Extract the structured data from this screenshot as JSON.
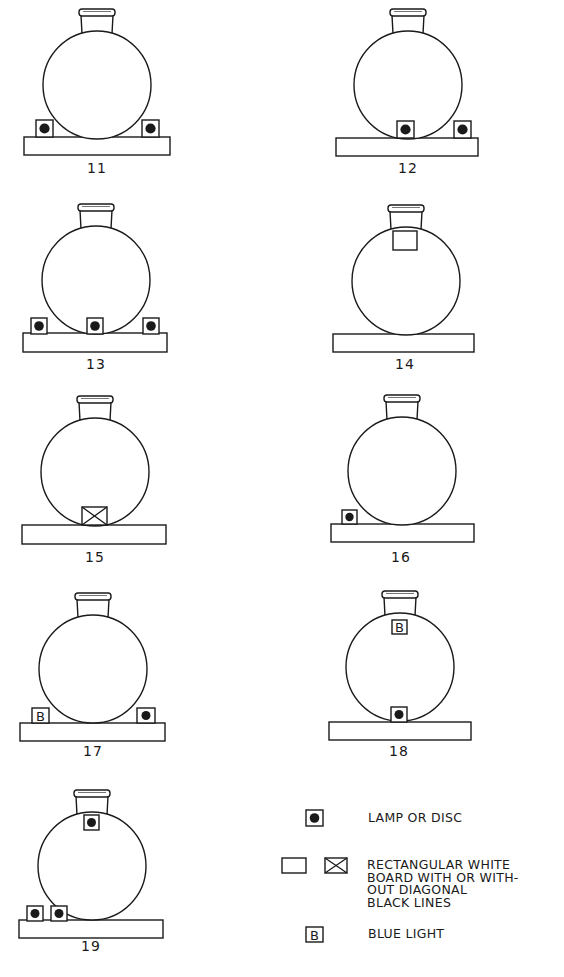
{
  "colors": {
    "ink": "#1a1a1a",
    "paper": "#ffffff"
  },
  "figures": [
    {
      "label": "11",
      "cx": 97,
      "cy": 85,
      "labelY": 160,
      "base": {
        "x1": 24,
        "x2": 170,
        "y1": 137,
        "y2": 155
      },
      "markers": [
        {
          "type": "lamp",
          "x": 36,
          "y": 120,
          "w": 17,
          "h": 17
        },
        {
          "type": "lamp",
          "x": 142,
          "y": 120,
          "w": 17,
          "h": 17
        }
      ]
    },
    {
      "label": "12",
      "cx": 408,
      "cy": 85,
      "labelY": 160,
      "base": {
        "x1": 336,
        "x2": 478,
        "y1": 138,
        "y2": 156
      },
      "markers": [
        {
          "type": "lamp",
          "x": 397,
          "y": 121,
          "w": 17,
          "h": 17
        },
        {
          "type": "lamp",
          "x": 454,
          "y": 121,
          "w": 17,
          "h": 17
        }
      ]
    },
    {
      "label": "13",
      "cx": 96,
      "cy": 280,
      "labelY": 356,
      "base": {
        "x1": 23,
        "x2": 167,
        "y1": 333,
        "y2": 352
      },
      "markers": [
        {
          "type": "lamp",
          "x": 31,
          "y": 318,
          "w": 16,
          "h": 16
        },
        {
          "type": "lamp",
          "x": 87,
          "y": 318,
          "w": 16,
          "h": 16
        },
        {
          "type": "lamp",
          "x": 143,
          "y": 318,
          "w": 16,
          "h": 16
        }
      ]
    },
    {
      "label": "14",
      "cx": 406,
      "cy": 281,
      "labelY": 356,
      "base": {
        "x1": 333,
        "x2": 474,
        "y1": 334,
        "y2": 352
      },
      "markers": [
        {
          "type": "board",
          "x": 393,
          "y": 231,
          "w": 24,
          "h": 19
        }
      ]
    },
    {
      "label": "15",
      "cx": 95,
      "cy": 472,
      "labelY": 549,
      "base": {
        "x1": 22,
        "x2": 166,
        "y1": 525,
        "y2": 544
      },
      "markers": [
        {
          "type": "board-x",
          "x": 82,
          "y": 507,
          "w": 25,
          "h": 18
        }
      ]
    },
    {
      "label": "16",
      "cx": 402,
      "cy": 471,
      "labelY": 549,
      "base": {
        "x1": 331,
        "x2": 474,
        "y1": 524,
        "y2": 542
      },
      "markers": [
        {
          "type": "lamp",
          "x": 342,
          "y": 510,
          "w": 15,
          "h": 14
        }
      ]
    },
    {
      "label": "17",
      "cx": 93,
      "cy": 669,
      "labelY": 743,
      "base": {
        "x1": 20,
        "x2": 165,
        "y1": 723,
        "y2": 741
      },
      "markers": [
        {
          "type": "blue",
          "x": 32,
          "y": 708,
          "w": 17,
          "h": 15
        },
        {
          "type": "lamp",
          "x": 137,
          "y": 708,
          "w": 18,
          "h": 15
        }
      ]
    },
    {
      "label": "18",
      "cx": 400,
      "cy": 667,
      "labelY": 743,
      "base": {
        "x1": 329,
        "x2": 471,
        "y1": 722,
        "y2": 740
      },
      "markers": [
        {
          "type": "blue",
          "x": 392,
          "y": 620,
          "w": 15,
          "h": 14
        },
        {
          "type": "lamp",
          "x": 391,
          "y": 707,
          "w": 16,
          "h": 15
        }
      ]
    },
    {
      "label": "19",
      "cx": 92,
      "cy": 866,
      "labelY": 938,
      "base": {
        "x1": 19,
        "x2": 163,
        "y1": 920,
        "y2": 938
      },
      "markers": [
        {
          "type": "lamp",
          "x": 84,
          "y": 815,
          "w": 15,
          "h": 15
        },
        {
          "type": "lamp",
          "x": 27,
          "y": 906,
          "w": 16,
          "h": 15
        },
        {
          "type": "lamp",
          "x": 51,
          "y": 906,
          "w": 16,
          "h": 15
        }
      ]
    }
  ],
  "legend": {
    "lamp": {
      "label": "LAMP OR DISC"
    },
    "board": {
      "lines": [
        "RECTANGULAR WHITE",
        "BOARD WITH OR WITH-",
        "OUT DIAGONAL",
        "BLACK LINES"
      ]
    },
    "blue": {
      "label": "BLUE LIGHT",
      "glyph": "B"
    }
  },
  "labels": {
    "f11": "11",
    "f12": "12",
    "f13": "13",
    "f14": "14",
    "f15": "15",
    "f16": "16",
    "f17": "17",
    "f18": "18",
    "f19": "19"
  }
}
